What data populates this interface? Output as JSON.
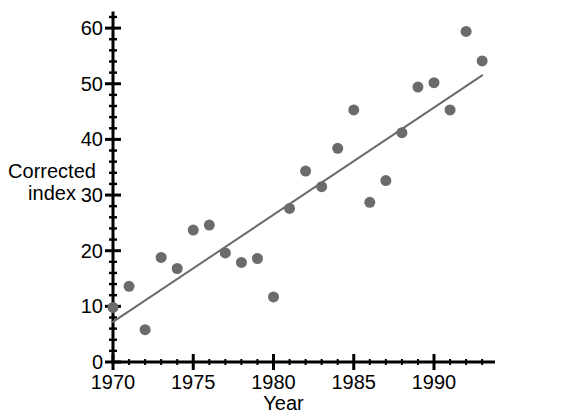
{
  "chart_data": {
    "type": "scatter",
    "title": "",
    "xlabel": "Year",
    "ylabel_line1": "Corrected",
    "ylabel_line2": "index",
    "xlim": [
      1970,
      1993.8
    ],
    "ylim": [
      0,
      63
    ],
    "grid": false,
    "legend": null,
    "x_ticks": [
      1970,
      1975,
      1980,
      1985,
      1990
    ],
    "x_tick_labels": [
      "1970",
      "1975",
      "1980",
      "1985",
      "1990"
    ],
    "x_minor_step": 1,
    "y_ticks": [
      0,
      10,
      20,
      30,
      40,
      50,
      60
    ],
    "y_tick_labels": [
      "0",
      "10",
      "20",
      "30",
      "40",
      "50",
      "60"
    ],
    "y_minor_step": 2,
    "marker": "filled-circle",
    "marker_color": "#6b6b6b",
    "marker_size_px": 11,
    "axis_color": "#000000",
    "x": [
      1970,
      1971,
      1972,
      1973,
      1974,
      1975,
      1976,
      1977,
      1978,
      1979,
      1980,
      1981,
      1982,
      1983,
      1984,
      1985,
      1986,
      1987,
      1988,
      1989,
      1990,
      1991,
      1992,
      1993
    ],
    "y": [
      9.8,
      13.6,
      5.8,
      18.8,
      16.8,
      23.7,
      24.6,
      19.6,
      17.9,
      18.6,
      11.7,
      27.6,
      34.3,
      31.5,
      38.4,
      45.3,
      28.7,
      32.6,
      41.2,
      49.4,
      50.2,
      45.3,
      59.4,
      54.1
    ],
    "series": [
      {
        "name": "Corrected index",
        "values": [
          9.8,
          13.6,
          5.8,
          18.8,
          16.8,
          23.7,
          24.6,
          19.6,
          17.9,
          18.6,
          11.7,
          27.6,
          34.3,
          31.5,
          38.4,
          45.3,
          28.7,
          32.6,
          41.2,
          49.4,
          50.2,
          45.3,
          59.4,
          54.1
        ]
      }
    ],
    "trendline": {
      "type": "linear-fit",
      "color": "#6b6b6b",
      "width_px": 2,
      "x_start": 1970,
      "y_start": 7.2,
      "x_end": 1993,
      "y_end": 51.5
    }
  }
}
